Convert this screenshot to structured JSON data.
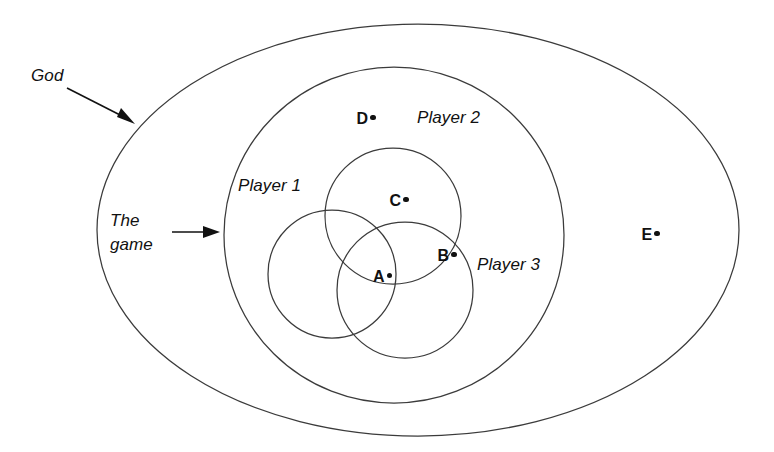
{
  "figure": {
    "kind": "nested-set-venn-diagram",
    "background_color": "#ffffff",
    "stroke_color": "#3b3b3b",
    "text_color": "#111111"
  },
  "callouts": [
    {
      "id": "god",
      "text": "God",
      "points_to": "outer-ellipse"
    },
    {
      "id": "the-game",
      "line1": "The",
      "line2": "game",
      "points_to": "inner-ellipse"
    }
  ],
  "regions": [
    {
      "id": "outer-ellipse",
      "label": "",
      "shape": "ellipse"
    },
    {
      "id": "inner-ellipse",
      "label": "Player 2",
      "shape": "ellipse"
    },
    {
      "id": "circle-player-1",
      "label": "Player 1",
      "shape": "circle"
    },
    {
      "id": "circle-player-2",
      "label": "",
      "shape": "circle"
    },
    {
      "id": "circle-player-3",
      "label": "Player 3",
      "shape": "circle"
    }
  ],
  "region_labels": {
    "player1": "Player 1",
    "player2": "Player 2",
    "player3": "Player 3"
  },
  "points": [
    {
      "id": "a",
      "label": "A",
      "x": 360,
      "y": 258
    },
    {
      "id": "b",
      "label": "B",
      "x": 424,
      "y": 237
    },
    {
      "id": "c",
      "label": "C",
      "x": 376,
      "y": 182
    },
    {
      "id": "d",
      "label": "D",
      "x": 342,
      "y": 100
    },
    {
      "id": "e",
      "label": "E",
      "x": 627,
      "y": 216
    }
  ]
}
